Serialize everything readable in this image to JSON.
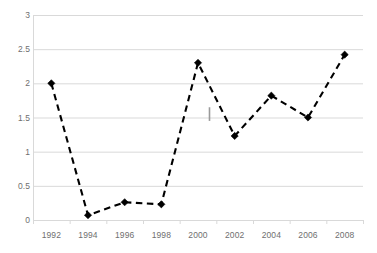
{
  "chart_data": {
    "type": "line",
    "title": "",
    "xlabel": "",
    "ylabel": "",
    "categories": [
      1992,
      1994,
      1996,
      1998,
      2000,
      2002,
      2004,
      2006,
      2008
    ],
    "x_tick_labels": [
      "1992",
      "1994",
      "1996",
      "1998",
      "2000",
      "2002",
      "2004",
      "2006",
      "2008"
    ],
    "values": [
      2.0,
      0.07,
      0.26,
      0.23,
      2.3,
      1.23,
      1.82,
      1.5,
      2.42
    ],
    "series": [
      {
        "name": "series-1",
        "values": [
          2.0,
          0.07,
          0.26,
          0.23,
          2.3,
          1.23,
          1.82,
          1.5,
          2.42
        ],
        "line_style": "dashed",
        "line_color": "#000000",
        "marker": "diamond",
        "marker_color": "#000000"
      }
    ],
    "ylim": [
      0,
      3
    ],
    "y_ticks": [
      0,
      0.5,
      1,
      1.5,
      2,
      2.5,
      3
    ],
    "y_tick_labels": [
      "0",
      "0.5",
      "1",
      "1.5",
      "2",
      "2.5",
      "3"
    ],
    "xlim": [
      1991,
      2009
    ],
    "grid": "horizontal",
    "grid_color": "#d9d9d9",
    "legend": "none",
    "background_color": "#ffffff",
    "annotations": [
      {
        "name": "error-bar-mark",
        "x": 2000.6,
        "y_top": 1.65,
        "y_bottom": 1.45,
        "color": "#9a9a9a"
      }
    ]
  }
}
